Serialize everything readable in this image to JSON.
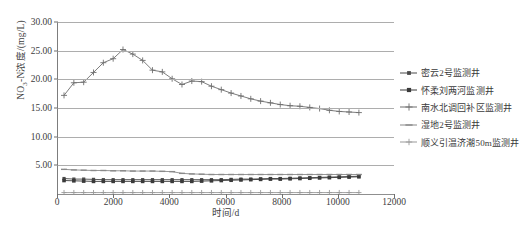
{
  "chart_data": {
    "type": "line",
    "title": "",
    "xlabel": "时间/d",
    "ylabel": "NO3-N浓度/(mg/L)",
    "xlim": [
      0,
      12000
    ],
    "ylim": [
      0,
      30
    ],
    "xticks": [
      0,
      2000,
      4000,
      6000,
      8000,
      10000,
      12000
    ],
    "yticks": [
      5.0,
      10.0,
      15.0,
      20.0,
      25.0,
      30.0
    ],
    "ytick_labels": [
      "5.00",
      "10.00",
      "15.00",
      "20.00",
      "25.00",
      "30.00"
    ],
    "xtick_labels": [
      "0",
      "2000",
      "4000",
      "6000",
      "8000",
      "10000",
      "12000"
    ],
    "grid": "horizontal",
    "legend_position": "right",
    "series": [
      {
        "name": "密云2号监测井",
        "color": "#4a4a4a",
        "marker": "square",
        "marker_size": 3.2,
        "x": [
          250,
          600,
          950,
          1300,
          1650,
          2000,
          2350,
          2700,
          3050,
          3400,
          3750,
          4100,
          4450,
          4800,
          5150,
          5500,
          5850,
          6200,
          6550,
          6900,
          7250,
          7600,
          7950,
          8300,
          8650,
          9000,
          9350,
          9700,
          10050,
          10400,
          10750
        ],
        "y": [
          2.7,
          2.6,
          2.6,
          2.55,
          2.5,
          2.5,
          2.5,
          2.5,
          2.5,
          2.5,
          2.5,
          2.5,
          2.5,
          2.5,
          2.5,
          2.5,
          2.5,
          2.55,
          2.6,
          2.6,
          2.65,
          2.7,
          2.7,
          2.75,
          2.8,
          2.85,
          2.9,
          2.95,
          3.0,
          3.05,
          3.1
        ]
      },
      {
        "name": "怀柔刘两河监测井",
        "color": "#3a3a3a",
        "marker": "square",
        "marker_size": 3.6,
        "x": [
          250,
          600,
          950,
          1300,
          1650,
          2000,
          2350,
          2700,
          3050,
          3400,
          3750,
          4100,
          4450,
          4800,
          5150,
          5500,
          5850,
          6200,
          6550,
          6900,
          7250,
          7600,
          7950,
          8300,
          8650,
          9000,
          9350,
          9700,
          10050,
          10400,
          10750
        ],
        "y": [
          2.35,
          2.3,
          2.25,
          2.2,
          2.2,
          2.2,
          2.2,
          2.2,
          2.2,
          2.2,
          2.2,
          2.2,
          2.2,
          2.2,
          2.25,
          2.3,
          2.35,
          2.4,
          2.45,
          2.5,
          2.55,
          2.6,
          2.6,
          2.65,
          2.7,
          2.75,
          2.8,
          2.85,
          2.9,
          2.95,
          3.0
        ]
      },
      {
        "name": "南水北调回补区监测井",
        "color": "#6e6e6e",
        "marker": "plus",
        "marker_size": 3.0,
        "x": [
          250,
          600,
          950,
          1300,
          1650,
          2000,
          2350,
          2700,
          3050,
          3400,
          3750,
          4100,
          4450,
          4800,
          5150,
          5500,
          5850,
          6200,
          6550,
          6900,
          7250,
          7600,
          7950,
          8300,
          8650,
          9000,
          9350,
          9700,
          10050,
          10400,
          10750
        ],
        "y": [
          17.2,
          19.4,
          19.5,
          21.2,
          22.9,
          23.6,
          25.2,
          24.4,
          23.3,
          21.6,
          21.3,
          20.1,
          19.1,
          19.7,
          19.6,
          18.8,
          18.2,
          17.6,
          17.1,
          16.6,
          16.2,
          15.9,
          15.6,
          15.4,
          15.3,
          15.1,
          14.9,
          14.6,
          14.4,
          14.3,
          14.2
        ]
      },
      {
        "name": "湿地2号监测井",
        "color": "#8a8a8a",
        "marker": "dash",
        "marker_size": 3.0,
        "x": [
          250,
          600,
          950,
          1300,
          1650,
          2000,
          2350,
          2700,
          3050,
          3400,
          3750,
          4100,
          4450,
          4800,
          5150,
          5500,
          5850,
          6200,
          6550,
          6900,
          7250,
          7600,
          7950,
          8300,
          8650,
          9000,
          9350,
          9700,
          10050,
          10400,
          10750
        ],
        "y": [
          4.3,
          4.2,
          4.15,
          4.1,
          4.1,
          4.05,
          4.05,
          4.0,
          4.0,
          4.0,
          3.95,
          3.9,
          3.6,
          3.5,
          3.45,
          3.4,
          3.4,
          3.4,
          3.4,
          3.4,
          3.4,
          3.4,
          3.4,
          3.4,
          3.4,
          3.4,
          3.4,
          3.4,
          3.4,
          3.4,
          3.4
        ]
      },
      {
        "name": "顺义引温济潮50m监测井",
        "color": "#9a9a9a",
        "marker": "plus",
        "marker_size": 2.6,
        "x": [
          250,
          600,
          950,
          1300,
          1650,
          2000,
          2350,
          2700,
          3050,
          3400,
          3750,
          4100,
          4450,
          4800,
          5150,
          5500,
          5850,
          6200,
          6550,
          6900,
          7250,
          7600,
          7950,
          8300,
          8650,
          9000,
          9350,
          9700,
          10050,
          10400,
          10750
        ],
        "y": [
          0.25,
          0.25,
          0.25,
          0.25,
          0.25,
          0.25,
          0.25,
          0.25,
          0.25,
          0.25,
          0.25,
          0.25,
          0.25,
          0.25,
          0.25,
          0.25,
          0.25,
          0.25,
          0.25,
          0.25,
          0.25,
          0.25,
          0.25,
          0.25,
          0.25,
          0.25,
          0.25,
          0.25,
          0.25,
          0.25,
          0.25
        ]
      }
    ]
  },
  "caption": ""
}
